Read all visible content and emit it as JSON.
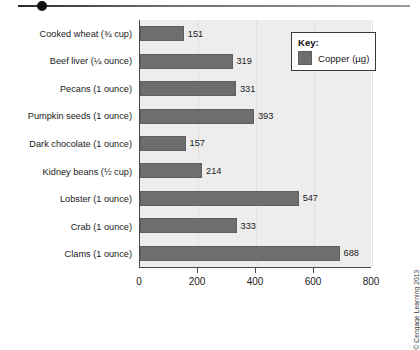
{
  "decoration": {
    "rule_name": "top-divider-rule",
    "bullet_name": "top-bullet-dot"
  },
  "legend": {
    "title": "Key:",
    "entries": [
      {
        "label": "Copper (µg)",
        "color": "#6e6e6e"
      }
    ]
  },
  "credit": "© Cengage Learning 2013",
  "colors": {
    "bar": "#6e6e6e",
    "plot_background": "#ededed",
    "axis": "#4a4a4a",
    "gridline": "#e0e0e0"
  },
  "chart_data": {
    "type": "bar",
    "orientation": "horizontal",
    "title": "",
    "xlabel": "",
    "ylabel": "",
    "xlim": [
      0,
      800
    ],
    "xticks": [
      0,
      200,
      400,
      600,
      800
    ],
    "grid": true,
    "legend_position": "top-right",
    "series_name": "Copper (µg)",
    "units": "µg",
    "categories": [
      "Cooked wheat (¾ cup)",
      "Beef liver (¼ ounce)",
      "Pecans (1 ounce)",
      "Pumpkin seeds (1 ounce)",
      "Dark chocolate (1 ounce)",
      "Kidney beans (½ cup)",
      "Lobster (1 ounce)",
      "Crab (1 ounce)",
      "Clams (1 ounce)"
    ],
    "values": [
      151,
      319,
      331,
      393,
      157,
      214,
      547,
      333,
      688
    ]
  }
}
